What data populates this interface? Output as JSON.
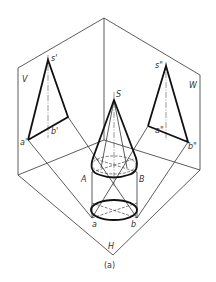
{
  "figure": {
    "caption": "(a)"
  },
  "planes": {
    "V": "V",
    "W": "W",
    "H": "H"
  },
  "labels": {
    "apex": "S",
    "A": "A",
    "B": "B",
    "s_v": "s'",
    "a_v": "a'",
    "b_v": "b'",
    "s_w": "s\"",
    "a_w": "a\"",
    "b_w": "b\"",
    "a_h": "a",
    "b_h": "b"
  },
  "colors": {
    "line": "#333333",
    "outline": "#111111",
    "background": "#ffffff"
  }
}
